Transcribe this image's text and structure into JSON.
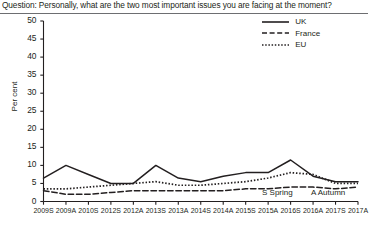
{
  "question": {
    "text": "Question: Personally, what are the two most important issues you are facing at the moment?"
  },
  "legend": {
    "position": "top-right",
    "items": [
      {
        "label": "UK",
        "style": "solid",
        "icon": "solid-line-icon"
      },
      {
        "label": "France",
        "style": "dashed",
        "icon": "dashed-line-icon"
      },
      {
        "label": "EU",
        "style": "dotted",
        "icon": "dotted-line-icon"
      }
    ]
  },
  "axes": {
    "ylabel": "Per cent",
    "yticks": [
      "0",
      "5",
      "10",
      "15",
      "20",
      "25",
      "30",
      "35",
      "40",
      "45",
      "50"
    ],
    "xticks": [
      "2009S",
      "2009A",
      "2010S",
      "2012S",
      "2012A",
      "2013S",
      "2013A",
      "2014S",
      "2014A",
      "2015S",
      "2015A",
      "2016S",
      "2016A",
      "2017S",
      "2017A"
    ]
  },
  "notes": {
    "spring": "S Spring",
    "autumn": "A Autumn"
  },
  "colors": {
    "line": "#231f20",
    "axis": "#231f20",
    "rule": "#6d6e71",
    "background": "#ffffff"
  },
  "chart_data": {
    "type": "line",
    "title": "Question: Personally, what are the two most important issues you are facing at the moment?",
    "xlabel": "",
    "ylabel": "Per cent",
    "ylim": [
      0,
      50
    ],
    "ytick_step": 5,
    "grid": false,
    "legend_position": "top-right",
    "categories": [
      "2009S",
      "2009A",
      "2010S",
      "2012S",
      "2012A",
      "2013S",
      "2013A",
      "2014S",
      "2014A",
      "2015S",
      "2015A",
      "2016S",
      "2016A",
      "2017S",
      "2017A"
    ],
    "series": [
      {
        "name": "UK",
        "style": "solid",
        "values": [
          6.5,
          10.0,
          7.5,
          5.0,
          5.0,
          10.0,
          6.5,
          5.5,
          7.0,
          8.0,
          8.0,
          11.5,
          7.0,
          5.5,
          5.5
        ]
      },
      {
        "name": "France",
        "style": "dashed",
        "values": [
          3.0,
          2.0,
          2.0,
          2.5,
          3.0,
          3.0,
          3.0,
          3.0,
          3.0,
          3.5,
          3.5,
          4.0,
          4.0,
          3.5,
          4.0
        ]
      },
      {
        "name": "EU",
        "style": "dotted",
        "values": [
          3.5,
          3.5,
          4.0,
          4.5,
          5.0,
          5.5,
          4.5,
          4.5,
          5.0,
          5.5,
          6.5,
          8.0,
          7.5,
          5.0,
          5.0
        ]
      }
    ]
  }
}
